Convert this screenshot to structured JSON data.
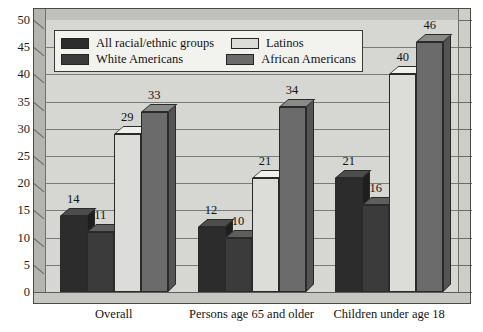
{
  "chart_data": {
    "type": "bar",
    "title": "",
    "xlabel": "",
    "ylabel": "",
    "ylim": [
      0,
      50
    ],
    "ytick_step": 5,
    "yticks": [
      50,
      45,
      40,
      35,
      30,
      25,
      20,
      15,
      10,
      5,
      0
    ],
    "grid": true,
    "legend_position": "top-left-inside",
    "three_d": true,
    "categories": [
      "Overall",
      "Persons age 65 and older",
      "Children under age 18"
    ],
    "series": [
      {
        "name": "All racial/ethnic groups",
        "color": "#2c2c2c",
        "values": [
          14,
          12,
          21
        ]
      },
      {
        "name": "White Americans",
        "color": "#3b3b3b",
        "values": [
          11,
          10,
          16
        ]
      },
      {
        "name": "Latinos",
        "color": "#dcdcd8",
        "values": [
          29,
          21,
          40
        ]
      },
      {
        "name": "African Americans",
        "color": "#6b6b6b",
        "values": [
          33,
          34,
          46
        ]
      }
    ],
    "data_labels": [
      [
        "14",
        "11",
        "29",
        "33"
      ],
      [
        "12",
        "10",
        "21",
        "34"
      ],
      [
        "21",
        "16",
        "40",
        "46"
      ]
    ]
  },
  "colors": {
    "plot_background": "#d6d6d2",
    "gridline": "#7b7b77",
    "frame": "#4a4a46",
    "legend_background": "#f2f2ee",
    "page_background": "#ffffff"
  }
}
